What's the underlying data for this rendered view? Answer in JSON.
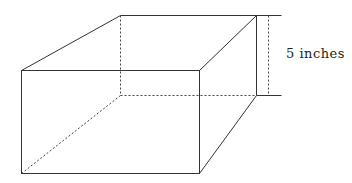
{
  "diagram": {
    "type": "rectangular-prism",
    "dimension_label": "5 inches",
    "line_color": "#333333"
  }
}
